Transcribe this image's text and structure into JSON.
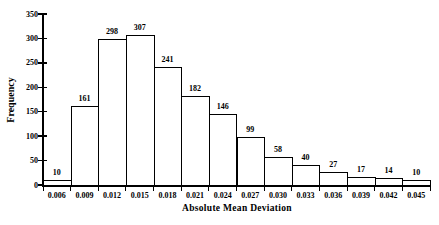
{
  "chart_data": {
    "type": "bar",
    "title": "",
    "xlabel": "Absolute Mean Deviation",
    "ylabel": "Frequency",
    "categories": [
      "0.006",
      "0.009",
      "0.012",
      "0.015",
      "0.018",
      "0.021",
      "0.024",
      "0.027",
      "0.030",
      "0.033",
      "0.036",
      "0.039",
      "0.042",
      "0.045"
    ],
    "values": [
      10,
      161,
      298,
      307,
      241,
      182,
      146,
      99,
      58,
      40,
      27,
      17,
      14,
      10
    ],
    "bar_labels_shown": true,
    "ylim": [
      0,
      350
    ],
    "yticks": [
      "0",
      "50",
      "100",
      "150",
      "200",
      "250",
      "300",
      "350"
    ],
    "grid": false,
    "legend": "none",
    "colors": {
      "bar_fill": "#ffffff",
      "bar_border": "#000000",
      "axis": "#000000",
      "text": "#000000",
      "background": "#ffffff"
    }
  }
}
